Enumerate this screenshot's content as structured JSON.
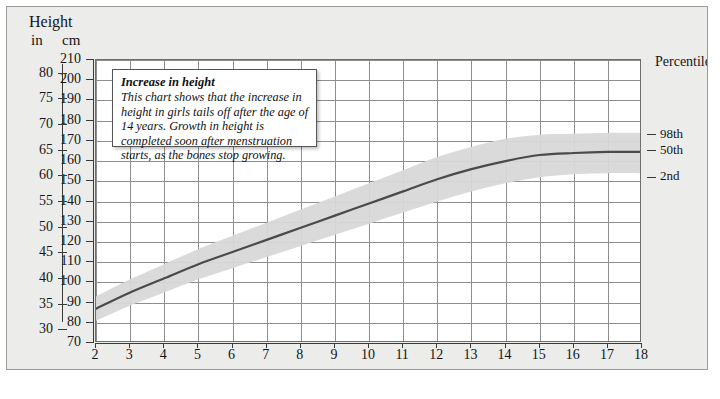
{
  "axes": {
    "height_label": "Height",
    "unit_in": "in",
    "unit_cm": "cm",
    "percentile_label": "Percentile",
    "x_title": "Age (years)"
  },
  "callout": {
    "title": "Increase in height",
    "body": "This chart shows that the increase in height in girls tails off after the age of 14 years. Growth in height is completed soon after menstruation starts, as the bones stop growing."
  },
  "chart_data": {
    "type": "line",
    "title": "Increase in height",
    "xlabel": "Age (years)",
    "ylabel": "Height",
    "xlim": [
      2,
      18
    ],
    "ylim": [
      70,
      210
    ],
    "grid": true,
    "legend_position": "right",
    "y_unit_primary": "cm",
    "y_unit_secondary": "in",
    "cm_ticks": [
      210,
      200,
      190,
      180,
      170,
      160,
      150,
      140,
      130,
      120,
      110,
      100,
      90,
      80,
      70
    ],
    "in_ticks": [
      80,
      75,
      70,
      65,
      60,
      55,
      50,
      45,
      40,
      35,
      30
    ],
    "x_ticks": [
      2,
      3,
      4,
      5,
      6,
      7,
      8,
      9,
      10,
      11,
      12,
      13,
      14,
      15,
      16,
      17,
      18
    ],
    "percentile_markers": [
      {
        "label": "98th",
        "cm": 173
      },
      {
        "label": "50th",
        "cm": 165
      },
      {
        "label": "2nd",
        "cm": 152
      }
    ],
    "series": [
      {
        "name": "50th",
        "type": "line",
        "color": "#4a4a4a",
        "x": [
          2,
          3,
          4,
          5,
          6,
          7,
          8,
          9,
          10,
          11,
          12,
          13,
          14,
          15,
          16,
          17,
          18
        ],
        "values": [
          87,
          95,
          102,
          109,
          115,
          121,
          127,
          133,
          139,
          145,
          151,
          156,
          160,
          163,
          164,
          164.5,
          164.5
        ]
      },
      {
        "name": "98th",
        "type": "band-upper",
        "color": "#d8d8d8",
        "x": [
          2,
          3,
          4,
          5,
          6,
          7,
          8,
          9,
          10,
          11,
          12,
          13,
          14,
          15,
          16,
          17,
          18
        ],
        "values": [
          93,
          101.5,
          109,
          116.5,
          123,
          129.5,
          136,
          142.5,
          149,
          155.5,
          162,
          167,
          171,
          173,
          173.5,
          174,
          174
        ]
      },
      {
        "name": "2nd",
        "type": "band-lower",
        "color": "#d8d8d8",
        "x": [
          2,
          3,
          4,
          5,
          6,
          7,
          8,
          9,
          10,
          11,
          12,
          13,
          14,
          15,
          16,
          17,
          18
        ],
        "values": [
          81,
          88.5,
          95,
          101.5,
          107,
          112.5,
          118,
          123.5,
          129,
          134.5,
          140,
          145,
          149,
          152,
          153.5,
          154,
          154
        ]
      }
    ]
  },
  "colors": {
    "page_background": "#ececeb",
    "plot_background": "#ffffff",
    "gridline": "#8e8e8e",
    "band": "#d8d8d8",
    "curve": "#4a4a4a",
    "text": "#151515"
  }
}
